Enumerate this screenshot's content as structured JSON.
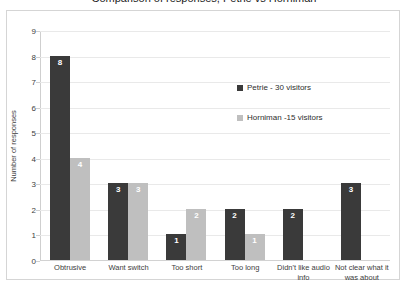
{
  "title": "Comparison of responses, Petrie vs Horniman",
  "chart_data": {
    "type": "bar",
    "title": "Comparison of responses, Petrie vs Horniman",
    "xlabel": "",
    "ylabel": "Number of responses",
    "ylim": [
      0,
      9
    ],
    "yticks": [
      "0",
      "1",
      "2",
      "3",
      "4",
      "5",
      "6",
      "7",
      "8",
      "9"
    ],
    "grid": true,
    "legend_position": "inside-upper-right",
    "categories": [
      "Obtrusive",
      "Want switch",
      "Too short",
      "Too long",
      "Didn't like audio info",
      "Not clear what it was about"
    ],
    "series": [
      {
        "name": "Petrie - 30 visitors",
        "color": "#3a3a3a",
        "values": [
          8,
          3,
          1,
          2,
          2,
          3
        ]
      },
      {
        "name": "Horniman -15 visitors",
        "color": "#bfbfbf",
        "values": [
          4,
          3,
          2,
          1,
          null,
          null
        ]
      }
    ]
  }
}
